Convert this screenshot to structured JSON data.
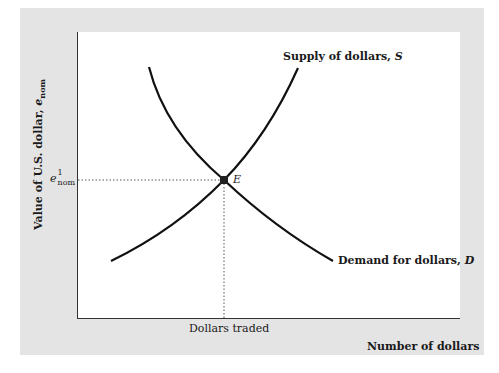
{
  "diagram": {
    "y_axis_label": "Value of U.S. dollar, ",
    "y_axis_symbol": "e",
    "y_axis_subscript": "nom",
    "x_axis_label": "Number of dollars",
    "y_tick": {
      "symbol": "e",
      "superscript": "1",
      "subscript": "nom"
    },
    "x_tick": "Dollars traded",
    "equilibrium_label": "E",
    "supply_label": "Supply of dollars, ",
    "supply_symbol": "S",
    "demand_label": "Demand for dollars, ",
    "demand_symbol": "D",
    "colors": {
      "panel": "#e4e4e4",
      "plot": "#ffffff",
      "curve": "#111111",
      "guide": "#555555"
    }
  }
}
